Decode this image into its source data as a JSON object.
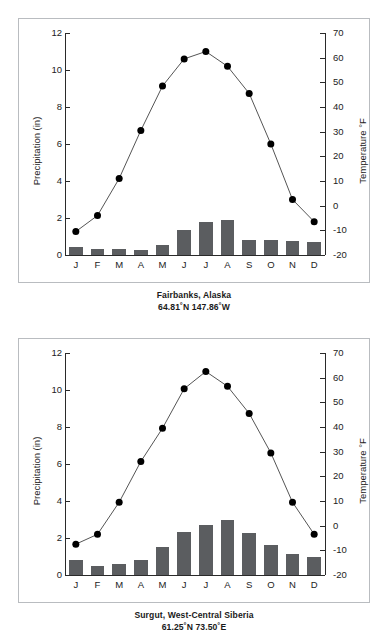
{
  "figure": {
    "panel_count": 2,
    "bar_color": "#5b5d60",
    "line_color": "#555555",
    "marker_color": "#000000",
    "border_color": "#b9bcc0"
  },
  "axes": {
    "left_label": "Precipitation (in)",
    "right_label": "Temperature °F",
    "precip_ticks": [
      "0",
      "2",
      "4",
      "6",
      "8",
      "10",
      "12"
    ],
    "precip_tick_values": [
      0,
      2,
      4,
      6,
      8,
      10,
      12
    ],
    "precip_range": [
      0,
      12
    ],
    "temp_ticks": [
      "-20",
      "-10",
      "0",
      "10",
      "20",
      "30",
      "40",
      "50",
      "60",
      "70"
    ],
    "temp_tick_values": [
      -20,
      -10,
      0,
      10,
      20,
      30,
      40,
      50,
      60,
      70
    ],
    "temp_range": [
      -20,
      70
    ],
    "months": [
      "J",
      "F",
      "M",
      "A",
      "M",
      "J",
      "J",
      "A",
      "S",
      "O",
      "N",
      "D"
    ]
  },
  "panels": [
    {
      "caption_line1": "Fairbanks, Alaska",
      "caption_line2": "64.81˚N 147.86˚W"
    },
    {
      "caption_line1": "Surgut, West-Central Siberia",
      "caption_line2": "61.25˚N  73.50˚E"
    }
  ],
  "chart_data": [
    {
      "type": "bar",
      "title": "Fairbanks, Alaska",
      "subtitle": "64.81˚N 147.86˚W",
      "categories": [
        "J",
        "F",
        "M",
        "A",
        "M",
        "J",
        "J",
        "A",
        "S",
        "O",
        "N",
        "D"
      ],
      "xlabel": "",
      "ylabel": "Precipitation (in)",
      "y2label": "Temperature °F",
      "ylim": [
        0,
        12
      ],
      "y2lim": [
        -20,
        70
      ],
      "grid": false,
      "legend": "none",
      "series": [
        {
          "name": "Precipitation (in)",
          "type": "bar",
          "axis": "left",
          "values": [
            0.42,
            0.35,
            0.34,
            0.25,
            0.55,
            1.33,
            1.8,
            1.9,
            0.83,
            0.83,
            0.75,
            0.72
          ]
        },
        {
          "name": "Temperature °F",
          "type": "line",
          "axis": "right",
          "values": [
            -10.5,
            -4.0,
            11.0,
            30.5,
            48.5,
            59.5,
            62.5,
            56.5,
            45.5,
            25.0,
            2.5,
            -6.5
          ]
        }
      ]
    },
    {
      "type": "bar",
      "title": "Surgut, West-Central Siberia",
      "subtitle": "61.25˚N  73.50˚E",
      "categories": [
        "J",
        "F",
        "M",
        "A",
        "M",
        "J",
        "J",
        "A",
        "S",
        "O",
        "N",
        "D"
      ],
      "xlabel": "",
      "ylabel": "Precipitation (in)",
      "y2label": "Temperature °F",
      "ylim": [
        0,
        12
      ],
      "y2lim": [
        -20,
        70
      ],
      "grid": false,
      "legend": "none",
      "series": [
        {
          "name": "Precipitation (in)",
          "type": "bar",
          "axis": "left",
          "values": [
            0.8,
            0.5,
            0.6,
            0.8,
            1.5,
            2.35,
            2.7,
            2.95,
            2.25,
            1.6,
            1.15,
            0.95
          ]
        },
        {
          "name": "Temperature °F",
          "type": "line",
          "axis": "right",
          "values": [
            -7.5,
            -3.5,
            9.5,
            26.0,
            39.5,
            55.5,
            62.5,
            56.5,
            45.5,
            29.5,
            9.5,
            -3.5
          ]
        }
      ]
    }
  ]
}
